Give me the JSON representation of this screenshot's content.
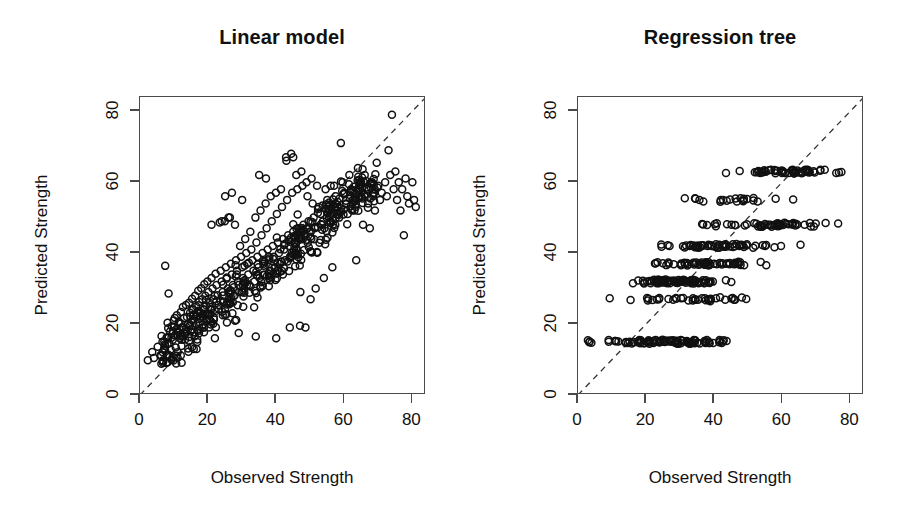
{
  "figure": {
    "background": "#ffffff",
    "foreground": "#111111",
    "point_style": "open-circle",
    "point_color": "#111111"
  },
  "panels": [
    {
      "key": "linear_model",
      "title": "Linear model",
      "xlabel": "Observed Strength",
      "ylabel": "Predicted Strength"
    },
    {
      "key": "regression_tree",
      "title": "Regression tree",
      "xlabel": "Observed Strength",
      "ylabel": "Predicted Strength"
    }
  ],
  "axis": {
    "x_ticks": [
      "0",
      "20",
      "40",
      "60",
      "80"
    ],
    "y_ticks": [
      "0",
      "20",
      "40",
      "60",
      "80"
    ]
  },
  "chart_data": [
    {
      "type": "scatter",
      "title": "Linear model",
      "xlabel": "Observed Strength",
      "ylabel": "Predicted Strength",
      "xlim": [
        0,
        84
      ],
      "ylim": [
        0,
        84
      ],
      "xticks": [
        0,
        20,
        40,
        60,
        80
      ],
      "yticks": [
        0,
        20,
        40,
        60,
        80
      ],
      "grid": false,
      "legend": "none",
      "annotations": [
        {
          "kind": "reference-line",
          "style": "dashed",
          "description": "identity line y = x from (0,0) to (84,84)"
        }
      ],
      "points": [
        [
          2.3,
          9.8
        ],
        [
          3.6,
          12.1
        ],
        [
          4.1,
          10.4
        ],
        [
          5.2,
          13.6
        ],
        [
          6.0,
          11.2
        ],
        [
          6.6,
          15.0
        ],
        [
          7.1,
          13.1
        ],
        [
          7.4,
          36.4
        ],
        [
          7.8,
          16.2
        ],
        [
          8.1,
          14.4
        ],
        [
          8.4,
          28.6
        ],
        [
          8.8,
          17.9
        ],
        [
          9.0,
          12.8
        ],
        [
          9.3,
          19.4
        ],
        [
          9.6,
          15.5
        ],
        [
          9.9,
          21.0
        ],
        [
          10.2,
          16.8
        ],
        [
          10.5,
          13.4
        ],
        [
          10.8,
          22.5
        ],
        [
          11.1,
          18.0
        ],
        [
          11.4,
          20.2
        ],
        [
          11.7,
          16.0
        ],
        [
          12.0,
          23.4
        ],
        [
          12.3,
          19.1
        ],
        [
          12.6,
          24.8
        ],
        [
          12.9,
          21.6
        ],
        [
          13.2,
          17.2
        ],
        [
          13.5,
          25.4
        ],
        [
          13.8,
          22.0
        ],
        [
          14.1,
          19.8
        ],
        [
          14.4,
          26.0
        ],
        [
          14.7,
          23.2
        ],
        [
          15.0,
          20.6
        ],
        [
          15.3,
          27.1
        ],
        [
          15.6,
          24.0
        ],
        [
          15.9,
          21.4
        ],
        [
          16.2,
          28.0
        ],
        [
          16.5,
          25.0
        ],
        [
          16.8,
          22.2
        ],
        [
          17.1,
          29.4
        ],
        [
          17.4,
          26.2
        ],
        [
          17.7,
          23.0
        ],
        [
          18.0,
          30.1
        ],
        [
          18.3,
          27.0
        ],
        [
          18.6,
          24.1
        ],
        [
          18.9,
          31.2
        ],
        [
          19.2,
          28.0
        ],
        [
          19.5,
          25.2
        ],
        [
          19.8,
          32.0
        ],
        [
          20.1,
          29.0
        ],
        [
          20.4,
          26.0
        ],
        [
          20.7,
          22.8
        ],
        [
          21.0,
          33.0
        ],
        [
          21.3,
          30.0
        ],
        [
          21.6,
          27.0
        ],
        [
          21.9,
          24.0
        ],
        [
          22.2,
          34.2
        ],
        [
          22.5,
          31.0
        ],
        [
          22.8,
          28.1
        ],
        [
          23.1,
          25.4
        ],
        [
          23.4,
          48.6
        ],
        [
          23.7,
          35.0
        ],
        [
          24.0,
          32.0
        ],
        [
          24.3,
          29.0
        ],
        [
          24.6,
          26.2
        ],
        [
          24.9,
          49.0
        ],
        [
          25.2,
          36.0
        ],
        [
          25.5,
          33.1
        ],
        [
          25.8,
          30.0
        ],
        [
          26.1,
          27.1
        ],
        [
          26.4,
          50.0
        ],
        [
          26.7,
          37.0
        ],
        [
          27.0,
          34.0
        ],
        [
          27.3,
          31.0
        ],
        [
          27.6,
          28.0
        ],
        [
          27.9,
          48.0
        ],
        [
          28.2,
          38.0
        ],
        [
          28.5,
          35.0
        ],
        [
          28.8,
          32.0
        ],
        [
          29.1,
          29.0
        ],
        [
          29.4,
          42.0
        ],
        [
          29.7,
          39.0
        ],
        [
          30.0,
          36.0
        ],
        [
          30.3,
          33.0
        ],
        [
          30.6,
          30.0
        ],
        [
          30.9,
          44.0
        ],
        [
          31.2,
          40.0
        ],
        [
          31.5,
          37.0
        ],
        [
          31.8,
          34.0
        ],
        [
          32.1,
          31.0
        ],
        [
          32.4,
          46.0
        ],
        [
          32.7,
          41.0
        ],
        [
          33.0,
          38.0
        ],
        [
          33.3,
          35.0
        ],
        [
          33.6,
          32.0
        ],
        [
          33.9,
          50.0
        ],
        [
          34.2,
          43.0
        ],
        [
          34.5,
          39.0
        ],
        [
          34.8,
          36.0
        ],
        [
          35.1,
          33.0
        ],
        [
          35.4,
          52.0
        ],
        [
          35.7,
          45.0
        ],
        [
          36.0,
          40.0
        ],
        [
          36.3,
          37.0
        ],
        [
          36.6,
          34.0
        ],
        [
          36.9,
          54.0
        ],
        [
          37.2,
          47.0
        ],
        [
          37.5,
          41.0
        ],
        [
          37.8,
          38.0
        ],
        [
          38.1,
          35.0
        ],
        [
          38.4,
          56.0
        ],
        [
          38.7,
          49.0
        ],
        [
          39.0,
          42.0
        ],
        [
          39.3,
          39.0
        ],
        [
          39.6,
          36.0
        ],
        [
          39.9,
          57.0
        ],
        [
          40.2,
          51.0
        ],
        [
          40.5,
          43.0
        ],
        [
          40.8,
          40.0
        ],
        [
          41.1,
          37.0
        ],
        [
          41.4,
          58.0
        ],
        [
          41.7,
          53.0
        ],
        [
          42.0,
          44.0
        ],
        [
          42.3,
          41.0
        ],
        [
          42.6,
          38.0
        ],
        [
          42.9,
          67.0
        ],
        [
          43.2,
          55.0
        ],
        [
          43.5,
          45.0
        ],
        [
          43.8,
          42.0
        ],
        [
          44.1,
          39.0
        ],
        [
          44.4,
          68.0
        ],
        [
          44.7,
          57.0
        ],
        [
          45.0,
          46.0
        ],
        [
          45.3,
          43.0
        ],
        [
          45.6,
          40.0
        ],
        [
          45.9,
          62.0
        ],
        [
          46.2,
          58.0
        ],
        [
          46.5,
          47.0
        ],
        [
          46.8,
          44.0
        ],
        [
          47.1,
          29.0
        ],
        [
          47.4,
          63.0
        ],
        [
          47.7,
          59.0
        ],
        [
          48.0,
          48.0
        ],
        [
          48.3,
          45.0
        ],
        [
          48.6,
          19.0
        ],
        [
          48.9,
          60.0
        ],
        [
          49.2,
          56.0
        ],
        [
          49.5,
          49.0
        ],
        [
          49.8,
          46.0
        ],
        [
          50.1,
          27.0
        ],
        [
          50.4,
          61.0
        ],
        [
          50.7,
          54.0
        ],
        [
          51.0,
          50.0
        ],
        [
          51.3,
          47.0
        ],
        [
          51.6,
          30.0
        ],
        [
          52.0,
          59.0
        ],
        [
          52.5,
          53.0
        ],
        [
          53.0,
          51.0
        ],
        [
          53.5,
          48.0
        ],
        [
          54.0,
          33.0
        ],
        [
          54.5,
          58.0
        ],
        [
          55.0,
          55.0
        ],
        [
          55.5,
          52.0
        ],
        [
          56.0,
          49.0
        ],
        [
          56.5,
          36.0
        ],
        [
          57.0,
          59.0
        ],
        [
          57.5,
          56.0
        ],
        [
          58.0,
          53.0
        ],
        [
          58.5,
          50.0
        ],
        [
          59.0,
          71.0
        ],
        [
          59.5,
          60.0
        ],
        [
          60.0,
          57.0
        ],
        [
          60.5,
          54.0
        ],
        [
          61.0,
          51.0
        ],
        [
          61.5,
          62.0
        ],
        [
          62.0,
          58.0
        ],
        [
          62.5,
          55.0
        ],
        [
          63.0,
          52.0
        ],
        [
          63.5,
          38.0
        ],
        [
          64.0,
          64.0
        ],
        [
          64.5,
          60.0
        ],
        [
          65.0,
          56.0
        ],
        [
          65.5,
          48.0
        ],
        [
          66.0,
          62.0
        ],
        [
          66.5,
          58.0
        ],
        [
          67.0,
          54.0
        ],
        [
          67.5,
          47.0
        ],
        [
          68.0,
          60.0
        ],
        [
          68.5,
          56.0
        ],
        [
          69.0,
          52.0
        ],
        [
          70.0,
          59.0
        ],
        [
          70.5,
          55.0
        ],
        [
          71.0,
          57.0
        ],
        [
          72.0,
          60.0
        ],
        [
          72.5,
          56.0
        ],
        [
          73.0,
          69.0
        ],
        [
          73.5,
          62.0
        ],
        [
          74.0,
          79.0
        ],
        [
          74.5,
          58.0
        ],
        [
          75.0,
          63.0
        ],
        [
          75.5,
          55.0
        ],
        [
          76.0,
          60.0
        ],
        [
          76.5,
          52.0
        ],
        [
          77.0,
          58.0
        ],
        [
          77.5,
          45.0
        ],
        [
          78.0,
          61.0
        ],
        [
          78.5,
          56.0
        ],
        [
          79.0,
          54.0
        ],
        [
          80.0,
          60.0
        ],
        [
          80.5,
          55.0
        ],
        [
          81.0,
          53.0
        ],
        [
          22.0,
          16.0
        ],
        [
          29.0,
          17.5
        ],
        [
          34.0,
          16.5
        ],
        [
          40.0,
          16.0
        ],
        [
          44.0,
          19.0
        ],
        [
          47.0,
          19.5
        ],
        [
          25.0,
          56.0
        ],
        [
          30.0,
          55.0
        ],
        [
          27.0,
          57.0
        ],
        [
          21.0,
          48.0
        ],
        [
          24.0,
          49.0
        ],
        [
          26.0,
          50.0
        ],
        [
          35.0,
          62.0
        ],
        [
          37.0,
          61.0
        ],
        [
          43.0,
          66.0
        ],
        [
          45.0,
          67.0
        ],
        [
          56.0,
          59.0
        ],
        [
          58.0,
          52.0
        ]
      ]
    },
    {
      "type": "scatter",
      "title": "Regression tree",
      "xlabel": "Observed Strength",
      "ylabel": "Predicted Strength",
      "xlim": [
        0,
        84
      ],
      "ylim": [
        0,
        84
      ],
      "xticks": [
        0,
        20,
        40,
        60,
        80
      ],
      "yticks": [
        0,
        20,
        40,
        60,
        80
      ],
      "grid": false,
      "legend": "none",
      "annotations": [
        {
          "kind": "reference-line",
          "style": "dashed",
          "description": "identity line y = x from (0,0) to (84,84)"
        },
        {
          "kind": "structure",
          "description": "predictions quantized into terminal-node levels (horizontal bands)"
        }
      ],
      "terminal_node_levels": [
        15,
        27,
        32,
        37,
        42,
        48,
        55,
        63
      ],
      "bands": [
        {
          "y": 15,
          "x_range": [
            2,
            50
          ],
          "count": 95
        },
        {
          "y": 27,
          "x_range": [
            6,
            60
          ],
          "count": 40
        },
        {
          "y": 32,
          "x_range": [
            12,
            46
          ],
          "count": 85
        },
        {
          "y": 37,
          "x_range": [
            21,
            56
          ],
          "count": 55
        },
        {
          "y": 42,
          "x_range": [
            20,
            66
          ],
          "count": 60
        },
        {
          "y": 48,
          "x_range": [
            31,
            80
          ],
          "count": 55
        },
        {
          "y": 55,
          "x_range": [
            24,
            67
          ],
          "count": 22
        },
        {
          "y": 63,
          "x_range": [
            41,
            81
          ],
          "count": 60
        }
      ]
    }
  ]
}
